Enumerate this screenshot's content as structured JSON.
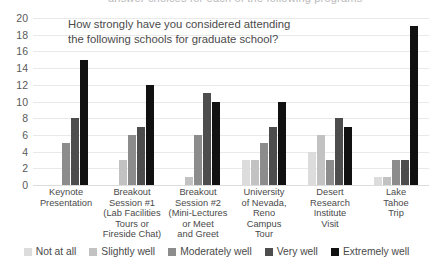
{
  "cutoff_text": "answer choices for each of the following programs",
  "chart_data": {
    "type": "bar",
    "title_lines": [
      "How strongly have you considered attending",
      "the following schools for graduate school?"
    ],
    "xlabel": "",
    "ylabel": "",
    "ylim": [
      0,
      20
    ],
    "ytick_step": 2,
    "yticks": [
      "0",
      "2",
      "4",
      "6",
      "8",
      "10",
      "12",
      "14",
      "16",
      "18",
      "20"
    ],
    "grid": "horizontal",
    "legend_position": "bottom",
    "categories": [
      "Keynote Presentation",
      "Breakout Session #1 (Lab Facilities Tours or Fireside Chat)",
      "Breakout Session #2 (Mini-Lectures or Meet and Greet",
      "University of Nevada, Reno Campus Tour",
      "Desert Research Institute Visit",
      "Lake Tahoe Trip"
    ],
    "category_lines": [
      [
        "Keynote",
        "Presentation"
      ],
      [
        "Breakout",
        "Session #1",
        "(Lab Facilities",
        "Tours or",
        "Fireside Chat)"
      ],
      [
        "Breakout",
        "Session #2",
        "(Mini-Lectures",
        "or Meet",
        "and Greet"
      ],
      [
        "University",
        "of Nevada,",
        "Reno",
        "Campus",
        "Tour"
      ],
      [
        "Desert",
        "Research",
        "Institute",
        "Visit"
      ],
      [
        "Lake",
        "Tahoe",
        "Trip"
      ]
    ],
    "series": [
      {
        "name": "Not at all",
        "color": "#dcdcdc",
        "values": [
          0,
          0,
          0,
          3,
          4,
          1
        ]
      },
      {
        "name": "Slightly well",
        "color": "#c2c2c2",
        "values": [
          0,
          3,
          1,
          3,
          6,
          1
        ]
      },
      {
        "name": "Moderately well",
        "color": "#8c8c8c",
        "values": [
          5,
          6,
          6,
          5,
          3,
          3
        ]
      },
      {
        "name": "Very well",
        "color": "#4d4d4d",
        "values": [
          8,
          7,
          11,
          7,
          8,
          3
        ]
      },
      {
        "name": "Extremely well",
        "color": "#111111",
        "values": [
          15,
          12,
          10,
          10,
          7,
          19
        ]
      }
    ]
  }
}
